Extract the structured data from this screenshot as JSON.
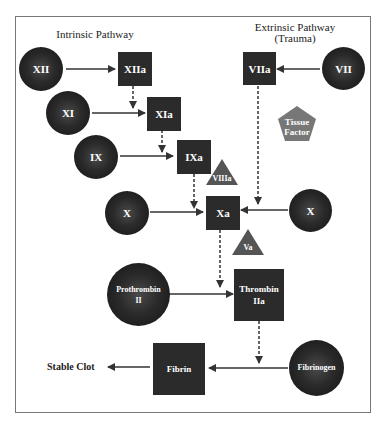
{
  "diagram": {
    "titles": {
      "intrinsic": "Intrinsic Pathway",
      "extrinsic": "Extrinsic Pathway\n(Trauma)"
    },
    "colors": {
      "node_dark": "#2b2b2b",
      "cofactor": "#555555",
      "tissue_factor": "#777777",
      "arrow": "#333333",
      "frame": "#777777"
    },
    "nodes": {
      "XII": "XII",
      "XIIa": "XIIa",
      "XI": "XI",
      "XIa": "XIa",
      "IX": "IX",
      "IXa": "IXa",
      "VIIIa": "VIIIa",
      "X_left": "X",
      "Xa": "Xa",
      "X_right": "X",
      "Va": "Va",
      "VIIa": "VIIa",
      "VII": "VII",
      "tissue_factor": "Tissue\nFactor",
      "prothrombin": "Prothrombin\nII",
      "thrombin": "Thrombin\nIIa",
      "fibrinogen": "Fibrinogen",
      "fibrin": "Fibrin",
      "stable_clot": "Stable Clot"
    }
  }
}
